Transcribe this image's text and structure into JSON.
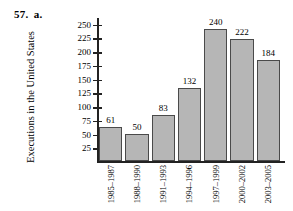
{
  "problem": {
    "number": "57.",
    "part": "a."
  },
  "chart_data": {
    "type": "bar",
    "title": "",
    "xlabel": "",
    "ylabel": "Executions in the United States",
    "categories": [
      "1985–1987",
      "1988–1990",
      "1991–1993",
      "1994–1996",
      "1997–1999",
      "2000–2002",
      "2003–2005"
    ],
    "values": [
      61,
      50,
      83,
      132,
      240,
      222,
      184
    ],
    "value_labels": [
      "61",
      "50",
      "83",
      "132",
      "240",
      "222",
      "184"
    ],
    "ylim": [
      0,
      262
    ],
    "yticks": [
      25,
      50,
      75,
      100,
      125,
      150,
      175,
      200,
      225,
      250
    ],
    "ytick_labels": [
      "25",
      "50",
      "75",
      "100",
      "125",
      "150",
      "175",
      "200",
      "225",
      "250"
    ],
    "grid": false,
    "legend": null,
    "bar_color": "#b6b6b6",
    "bar_border_color": "#4a4a4a",
    "axis_color": "#222222"
  }
}
